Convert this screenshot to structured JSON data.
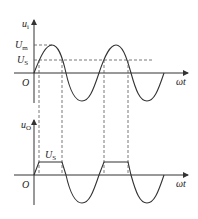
{
  "top_plot": {
    "y_label": "u",
    "y_label_sub": "i",
    "x_label": "ωt",
    "origin": "O",
    "levels": [
      {
        "label": "U",
        "sub": "m",
        "meaning": "peak amplitude"
      },
      {
        "label": "U",
        "sub": "S",
        "meaning": "clipping level"
      }
    ]
  },
  "bottom_plot": {
    "y_label": "u",
    "y_label_sub": "O",
    "x_label": "ωt",
    "origin": "O",
    "flat_label": "U",
    "flat_label_sub": "S"
  },
  "colors": {
    "line": "#333333",
    "dash": "#555555"
  }
}
